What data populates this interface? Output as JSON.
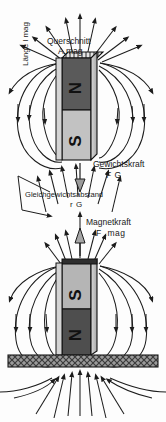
{
  "diagram": {
    "labels": {
      "querschnitt": "Querschnitt",
      "a_mag": "A.mag",
      "laenge": "Länge l mag",
      "gewichtskraft": "Gewichtskraft",
      "f_g": "F G",
      "gleichgewichtsabstand": "Gleichgewichtsabstand",
      "r_g": "r G",
      "magnetkraft": "Magnetkraft",
      "f_mag": "F .mag"
    },
    "magnets": {
      "upper": {
        "top_pole": "N",
        "bottom_pole": "S",
        "top_pole_color": "#5a5a5a",
        "bottom_pole_color": "#c2c2c2",
        "x": 62,
        "y": 58,
        "width": 35,
        "height": 102
      },
      "lower": {
        "top_pole": "S",
        "bottom_pole": "N",
        "top_pole_color": "#b5b5b5",
        "bottom_pole_color": "#4e4e4e",
        "x": 62,
        "y": 263,
        "width": 35,
        "height": 92
      }
    },
    "ground": {
      "name": "hatched-surface",
      "x": 8,
      "y": 355,
      "width": 150,
      "height": 12,
      "fill": "#8d8d8d"
    },
    "forces": [
      {
        "name": "weight-force",
        "symbol": "F G",
        "direction": "down",
        "label": "Gewichtskraft"
      },
      {
        "name": "magnetic-force",
        "symbol": "F .mag",
        "direction": "up",
        "label": "Magnetkraft"
      }
    ],
    "colors": {
      "field_line": "#1c1c1c",
      "magnet_outline": "#111111",
      "background": "#fdfdfd",
      "text": "#1a1a1a"
    }
  }
}
